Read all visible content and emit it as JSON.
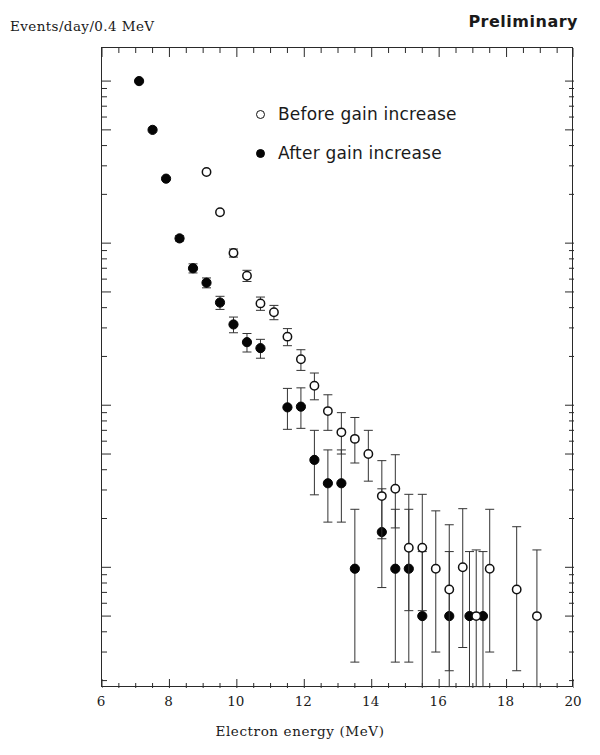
{
  "figure": {
    "ylabel": "Events/day/0.4 MeV",
    "xlabel": "Electron energy (MeV)",
    "annotation": "Preliminary",
    "marker_color": "#050505",
    "axis_color": "#2a2a2a",
    "background": "#ffffff"
  },
  "legend": {
    "before": "Before gain increase",
    "after": "After gain increase"
  },
  "axes": {
    "x_ticks": [
      "6",
      "8",
      "10",
      "12",
      "14",
      "16",
      "18",
      "20"
    ],
    "y_ticks": [
      "10.000",
      "5.000",
      "1.000",
      "0.500",
      "0.100",
      "0.050",
      "0.010",
      "0.005"
    ]
  },
  "chart_data": {
    "type": "scatter",
    "title": "",
    "xlabel": "Electron energy (MeV)",
    "ylabel": "Events/day/0.4 MeV",
    "annotation": "Preliminary",
    "xlim": [
      6,
      20
    ],
    "ylim": [
      0.0018,
      16.0
    ],
    "yscale": "log",
    "xscale": "linear",
    "grid": false,
    "legend_position": "upper-center-right",
    "xticks": [
      6,
      8,
      10,
      12,
      14,
      16,
      18,
      20
    ],
    "yticks": [
      10.0,
      5.0,
      1.0,
      0.5,
      0.1,
      0.05,
      0.01,
      0.005
    ],
    "ytick_labels": [
      "10.000",
      "5.000",
      "1.000",
      "0.500",
      "0.100",
      "0.050",
      "0.010",
      "0.005"
    ],
    "series": [
      {
        "name": "After gain increase",
        "marker": "filled-circle",
        "color": "#050505",
        "points": [
          {
            "x": 7.1,
            "y": 10.0,
            "yerr_low": 0.0,
            "yerr_high": 0.0
          },
          {
            "x": 7.5,
            "y": 5.0,
            "yerr_low": 0.0,
            "yerr_high": 0.0
          },
          {
            "x": 7.9,
            "y": 2.5,
            "yerr_low": 0.0,
            "yerr_high": 0.0
          },
          {
            "x": 8.3,
            "y": 1.07,
            "yerr_low": 0.04,
            "yerr_high": 0.04
          },
          {
            "x": 8.7,
            "y": 0.7,
            "yerr_low": 0.045,
            "yerr_high": 0.045
          },
          {
            "x": 9.1,
            "y": 0.57,
            "yerr_low": 0.04,
            "yerr_high": 0.04
          },
          {
            "x": 9.5,
            "y": 0.43,
            "yerr_low": 0.04,
            "yerr_high": 0.04
          },
          {
            "x": 9.9,
            "y": 0.315,
            "yerr_low": 0.035,
            "yerr_high": 0.035
          },
          {
            "x": 10.3,
            "y": 0.245,
            "yerr_low": 0.032,
            "yerr_high": 0.032
          },
          {
            "x": 10.7,
            "y": 0.225,
            "yerr_low": 0.03,
            "yerr_high": 0.03
          },
          {
            "x": 11.5,
            "y": 0.097,
            "yerr_low": 0.026,
            "yerr_high": 0.03
          },
          {
            "x": 11.9,
            "y": 0.098,
            "yerr_low": 0.026,
            "yerr_high": 0.03
          },
          {
            "x": 12.3,
            "y": 0.046,
            "yerr_low": 0.018,
            "yerr_high": 0.024
          },
          {
            "x": 12.7,
            "y": 0.033,
            "yerr_low": 0.014,
            "yerr_high": 0.02
          },
          {
            "x": 13.1,
            "y": 0.033,
            "yerr_low": 0.014,
            "yerr_high": 0.02
          },
          {
            "x": 13.5,
            "y": 0.0098,
            "yerr_low": 0.0072,
            "yerr_high": 0.013
          },
          {
            "x": 14.3,
            "y": 0.0165,
            "yerr_low": 0.009,
            "yerr_high": 0.014
          },
          {
            "x": 14.7,
            "y": 0.0098,
            "yerr_low": 0.0072,
            "yerr_high": 0.013
          },
          {
            "x": 15.1,
            "y": 0.0098,
            "yerr_low": 0.0072,
            "yerr_high": 0.013
          },
          {
            "x": 15.5,
            "y": 0.005,
            "yerr_low": 0.0032,
            "yerr_high": 0.0075
          },
          {
            "x": 16.3,
            "y": 0.005,
            "yerr_low": 0.0032,
            "yerr_high": 0.0075
          },
          {
            "x": 16.9,
            "y": 0.005,
            "yerr_low": 0.0032,
            "yerr_high": 0.0075
          },
          {
            "x": 17.3,
            "y": 0.005,
            "yerr_low": 0.0032,
            "yerr_high": 0.0075
          }
        ]
      },
      {
        "name": "Before gain increase",
        "marker": "open-circle",
        "color": "#111111",
        "points": [
          {
            "x": 9.1,
            "y": 2.75,
            "yerr_low": 0.0,
            "yerr_high": 0.0
          },
          {
            "x": 9.5,
            "y": 1.55,
            "yerr_low": 0.0,
            "yerr_high": 0.0
          },
          {
            "x": 9.9,
            "y": 0.87,
            "yerr_low": 0.05,
            "yerr_high": 0.05
          },
          {
            "x": 10.3,
            "y": 0.63,
            "yerr_low": 0.05,
            "yerr_high": 0.05
          },
          {
            "x": 10.7,
            "y": 0.425,
            "yerr_low": 0.04,
            "yerr_high": 0.04
          },
          {
            "x": 11.1,
            "y": 0.375,
            "yerr_low": 0.038,
            "yerr_high": 0.038
          },
          {
            "x": 11.5,
            "y": 0.265,
            "yerr_low": 0.032,
            "yerr_high": 0.032
          },
          {
            "x": 11.9,
            "y": 0.192,
            "yerr_low": 0.028,
            "yerr_high": 0.028
          },
          {
            "x": 12.3,
            "y": 0.132,
            "yerr_low": 0.024,
            "yerr_high": 0.026
          },
          {
            "x": 12.7,
            "y": 0.092,
            "yerr_low": 0.022,
            "yerr_high": 0.024
          },
          {
            "x": 13.1,
            "y": 0.068,
            "yerr_low": 0.018,
            "yerr_high": 0.022
          },
          {
            "x": 13.5,
            "y": 0.062,
            "yerr_low": 0.018,
            "yerr_high": 0.022
          },
          {
            "x": 13.9,
            "y": 0.05,
            "yerr_low": 0.016,
            "yerr_high": 0.02
          },
          {
            "x": 14.3,
            "y": 0.0275,
            "yerr_low": 0.0125,
            "yerr_high": 0.018
          },
          {
            "x": 14.7,
            "y": 0.0305,
            "yerr_low": 0.013,
            "yerr_high": 0.019
          },
          {
            "x": 15.1,
            "y": 0.0132,
            "yerr_low": 0.0078,
            "yerr_high": 0.015
          },
          {
            "x": 15.5,
            "y": 0.0132,
            "yerr_low": 0.0078,
            "yerr_high": 0.015
          },
          {
            "x": 15.9,
            "y": 0.0098,
            "yerr_low": 0.0068,
            "yerr_high": 0.0125
          },
          {
            "x": 16.3,
            "y": 0.0073,
            "yerr_low": 0.005,
            "yerr_high": 0.011
          },
          {
            "x": 16.7,
            "y": 0.01,
            "yerr_low": 0.0068,
            "yerr_high": 0.013
          },
          {
            "x": 17.1,
            "y": 0.005,
            "yerr_low": 0.0032,
            "yerr_high": 0.0078
          },
          {
            "x": 17.5,
            "y": 0.0098,
            "yerr_low": 0.0068,
            "yerr_high": 0.013
          },
          {
            "x": 18.3,
            "y": 0.0073,
            "yerr_low": 0.005,
            "yerr_high": 0.0105
          },
          {
            "x": 18.9,
            "y": 0.005,
            "yerr_low": 0.0032,
            "yerr_high": 0.0078
          }
        ]
      }
    ]
  }
}
